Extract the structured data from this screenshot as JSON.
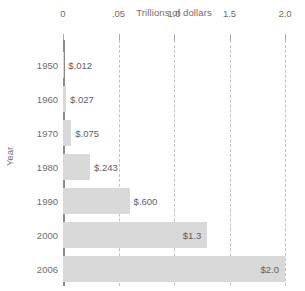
{
  "chart_data": {
    "type": "bar",
    "orientation": "horizontal",
    "title": "Trillions of dollars",
    "xlabel": "Trillions of dollars",
    "ylabel": "Year",
    "xlim": [
      0,
      2.0
    ],
    "xticks": [
      0,
      0.5,
      1.0,
      1.5,
      2.0
    ],
    "xtick_labels": [
      "0",
      ".05",
      "1.0",
      "1.5",
      "2.0"
    ],
    "grid": "vertical-dashed",
    "legend": "none",
    "categories": [
      "1950",
      "1960",
      "1970",
      "1980",
      "1990",
      "2000",
      "2006"
    ],
    "values": [
      0.012,
      0.027,
      0.075,
      0.243,
      0.6,
      1.3,
      2.0
    ],
    "data_labels": [
      "$.012",
      "$.027",
      "$.075",
      "$.243",
      "$.600",
      "$1.3",
      "$2.0"
    ],
    "label_placement": [
      "outside",
      "outside",
      "outside",
      "outside",
      "outside",
      "inside",
      "inside"
    ],
    "bar_color": "#d9d9d9",
    "axis_color": "#8a8a8a",
    "grid_color": "#c2c2c2",
    "text_color": "#6e6e6e"
  }
}
